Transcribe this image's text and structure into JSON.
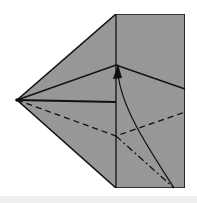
{
  "diagram": {
    "type": "origami-fold-step",
    "colors": {
      "paper": "#9a9a9a",
      "line": "#111111",
      "background": "#ffffff",
      "band": "#eeeeee"
    },
    "elements": [
      "paper outline (kite + rectangle)",
      "valley fold crease lines",
      "dashed valley fold line",
      "dash-dot mountain fold line",
      "curved fold arrow"
    ]
  }
}
